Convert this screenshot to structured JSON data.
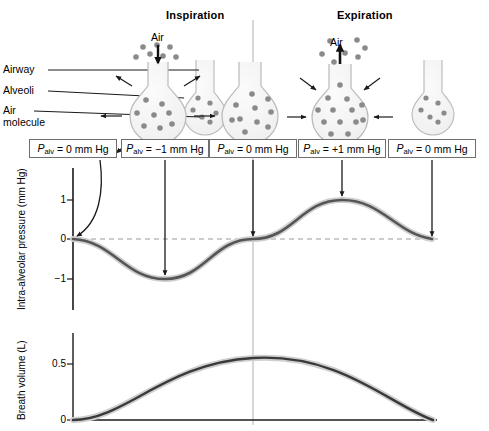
{
  "figure": {
    "phases": [
      {
        "name": "inspiration",
        "label": "Inspiration"
      },
      {
        "name": "expiration",
        "label": "Expiration"
      }
    ],
    "air_labels": [
      {
        "name": "air-label-inspiration",
        "label": "Air"
      },
      {
        "name": "air-label-expiration",
        "label": "Air"
      }
    ],
    "anatomy_labels": [
      {
        "name": "airway",
        "label": "Airway"
      },
      {
        "name": "alveoli",
        "label": "Alveoli"
      },
      {
        "name": "air-molecule-line1",
        "label": "Air"
      },
      {
        "name": "air-molecule-line2",
        "label": "molecule"
      }
    ],
    "pressure_boxes": [
      {
        "name": "pressure-box-1",
        "symbol": "P",
        "subscript": "alv",
        "equals": "=",
        "value": "0",
        "unit": "mm Hg",
        "x": 73
      },
      {
        "name": "pressure-box-2",
        "symbol": "P",
        "subscript": "alv",
        "equals": "=",
        "value": "−1",
        "unit": "mm Hg",
        "x": 165
      },
      {
        "name": "pressure-box-3",
        "symbol": "P",
        "subscript": "alv",
        "equals": "=",
        "value": "0",
        "unit": "mm Hg",
        "x": 253
      },
      {
        "name": "pressure-box-4",
        "symbol": "P",
        "subscript": "alv",
        "equals": "=",
        "value": "+1",
        "unit": "mm Hg",
        "x": 342
      },
      {
        "name": "pressure-box-5",
        "symbol": "P",
        "subscript": "alv",
        "equals": "=",
        "value": "0",
        "unit": "mm Hg",
        "x": 432
      }
    ],
    "alveoli_stages": [
      {
        "name": "alveolus-rest-start",
        "state": "resting",
        "molecule_count": 6,
        "size": "small"
      },
      {
        "name": "alveolus-inspiration",
        "state": "expanding",
        "molecule_count": 8,
        "size": "large"
      },
      {
        "name": "alveolus-mid",
        "state": "expanded",
        "molecule_count": 10,
        "size": "large"
      },
      {
        "name": "alveolus-expiration",
        "state": "contracting",
        "molecule_count": 13,
        "size": "large"
      },
      {
        "name": "alveolus-rest-end",
        "state": "resting",
        "molecule_count": 6,
        "size": "small"
      }
    ],
    "colors": {
      "curve": "#555555",
      "axis": "#1a1a1a",
      "box_border": "#6f6f6f",
      "alveolus_outline": "#b5b5b5",
      "molecule": "#8a8a8a",
      "divider": "#aaaaaa",
      "zero_dash": "#9a9a9a"
    }
  },
  "chart_data": [
    {
      "name": "intra-alveolar-pressure-chart",
      "type": "line",
      "title": "",
      "xlabel": "",
      "ylabel": "Intra-alveolar pressure (mm Hg)",
      "ylim": [
        -1.6,
        1.6
      ],
      "yticks": [
        1,
        0,
        -1
      ],
      "ytick_labels": [
        "1",
        "0",
        "−1"
      ],
      "grid": false,
      "zero_reference_line": "dashed",
      "x": [
        0,
        0.125,
        0.25,
        0.375,
        0.5,
        0.625,
        0.75,
        0.875,
        1.0
      ],
      "values": [
        0,
        -0.7,
        -1.0,
        -0.7,
        0,
        0.7,
        1.0,
        0.7,
        0
      ],
      "annotations": [
        {
          "name": "annotation-arrow-0",
          "x": 0.0,
          "y": 0,
          "value": "0 mm Hg",
          "style": "curved-arrow"
        },
        {
          "name": "annotation-arrow-1",
          "x": 0.25,
          "y": -1.0,
          "value": "−1 mm Hg",
          "style": "straight-arrow"
        },
        {
          "name": "annotation-arrow-2",
          "x": 0.5,
          "y": 0,
          "value": "0 mm Hg",
          "style": "straight-arrow"
        },
        {
          "name": "annotation-arrow-3",
          "x": 0.75,
          "y": 1.0,
          "value": "+1 mm Hg",
          "style": "straight-arrow"
        },
        {
          "name": "annotation-arrow-4",
          "x": 1.0,
          "y": 0,
          "value": "0 mm Hg",
          "style": "straight-arrow"
        }
      ]
    },
    {
      "name": "breath-volume-chart",
      "type": "line",
      "title": "",
      "xlabel": "",
      "ylabel": "Breath volume (L)",
      "ylim": [
        0,
        0.75
      ],
      "yticks": [
        0.5,
        0
      ],
      "ytick_labels": [
        "0.5",
        "0"
      ],
      "grid": false,
      "x": [
        0,
        0.125,
        0.25,
        0.375,
        0.5,
        0.625,
        0.75,
        0.875,
        1.0
      ],
      "values": [
        0,
        0.27,
        0.44,
        0.55,
        0.6,
        0.57,
        0.47,
        0.3,
        0
      ]
    }
  ]
}
